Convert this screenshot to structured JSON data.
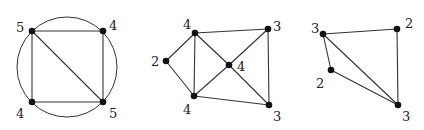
{
  "graphs": [
    {
      "id": "graph-1",
      "circle": {
        "cx": 67,
        "cy": 67,
        "r": 50
      },
      "vertices": [
        {
          "x": 32,
          "y": 31,
          "label": "5",
          "lx": 16,
          "ly": 32
        },
        {
          "x": 103,
          "y": 31,
          "label": "4",
          "lx": 109,
          "ly": 30
        },
        {
          "x": 32,
          "y": 102,
          "label": "4",
          "lx": 16,
          "ly": 118
        },
        {
          "x": 103,
          "y": 102,
          "label": "5",
          "lx": 109,
          "ly": 118
        }
      ],
      "edges": [
        [
          0,
          1
        ],
        [
          0,
          2
        ],
        [
          1,
          3
        ],
        [
          2,
          3
        ],
        [
          0,
          3
        ]
      ]
    },
    {
      "id": "graph-2",
      "vertices": [
        {
          "x": 195,
          "y": 33,
          "label": "4",
          "lx": 183,
          "ly": 29
        },
        {
          "x": 268,
          "y": 29,
          "label": "3",
          "lx": 273,
          "ly": 31
        },
        {
          "x": 166,
          "y": 61,
          "label": "2",
          "lx": 151,
          "ly": 66
        },
        {
          "x": 229,
          "y": 65,
          "label": "4",
          "lx": 237,
          "ly": 71
        },
        {
          "x": 194,
          "y": 96,
          "label": "4",
          "lx": 183,
          "ly": 114
        },
        {
          "x": 269,
          "y": 105,
          "label": "3",
          "lx": 273,
          "ly": 121
        }
      ],
      "edges": [
        [
          0,
          1
        ],
        [
          0,
          2
        ],
        [
          0,
          4
        ],
        [
          0,
          3
        ],
        [
          2,
          4
        ],
        [
          1,
          3
        ],
        [
          1,
          5
        ],
        [
          3,
          4
        ],
        [
          3,
          5
        ],
        [
          4,
          5
        ]
      ]
    },
    {
      "id": "graph-3",
      "vertices": [
        {
          "x": 323,
          "y": 34,
          "label": "3",
          "lx": 311,
          "ly": 33
        },
        {
          "x": 397,
          "y": 29,
          "label": "2",
          "lx": 405,
          "ly": 28
        },
        {
          "x": 331,
          "y": 70,
          "label": "2",
          "lx": 316,
          "ly": 88
        },
        {
          "x": 398,
          "y": 105,
          "label": "3",
          "lx": 402,
          "ly": 121
        }
      ],
      "edges": [
        [
          0,
          1
        ],
        [
          0,
          2
        ],
        [
          0,
          3
        ],
        [
          1,
          3
        ],
        [
          2,
          3
        ]
      ]
    }
  ]
}
